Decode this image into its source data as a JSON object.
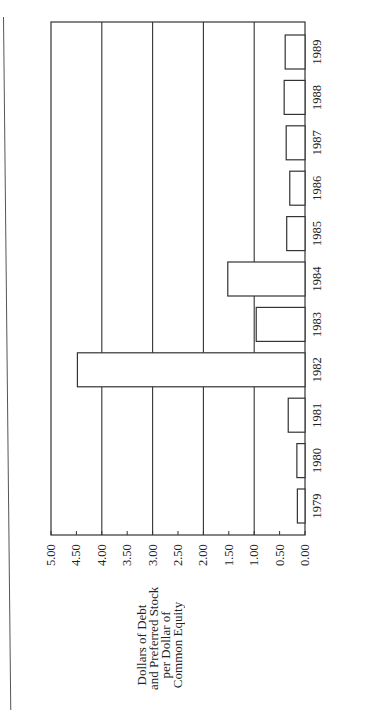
{
  "chart_data": {
    "type": "bar",
    "orientation": "vertical bars, page rotated 90 degrees clockwise",
    "title": "",
    "xlabel": "",
    "ylabel": "Dollars of Debt and Preferred Stock per Dollar of Common Equity",
    "ylabel_lines": [
      "Dollars of Debt",
      "and Preferred Stock",
      "per Dollar of",
      "Common Equity"
    ],
    "categories": [
      "1979",
      "1980",
      "1981",
      "1982",
      "1983",
      "1984",
      "1985",
      "1986",
      "1987",
      "1988",
      "1989"
    ],
    "values": [
      0.15,
      0.16,
      0.33,
      4.48,
      0.96,
      1.52,
      0.36,
      0.3,
      0.37,
      0.41,
      0.39
    ],
    "ylim": [
      0,
      5.0
    ],
    "yticks": [
      "0.00",
      "0.50",
      "1.00",
      "1.50",
      "2.00",
      "2.50",
      "3.00",
      "3.50",
      "4.00",
      "4.50",
      "5.00"
    ],
    "gridlines": [
      1.0,
      2.0,
      3.0,
      4.0
    ],
    "grid": true,
    "legend": null,
    "bar_fill": "#ffffff",
    "bar_stroke": "#333333"
  }
}
